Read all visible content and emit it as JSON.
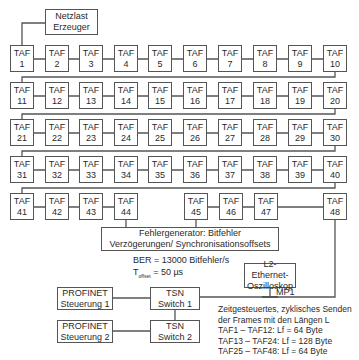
{
  "netzlast": {
    "line1": "Netzlast",
    "line2": "Erzeuger"
  },
  "taf_prefix": "TAF",
  "rows": [
    [
      "1",
      "2",
      "3",
      "4",
      "5",
      "6",
      "7",
      "8",
      "9",
      "10"
    ],
    [
      "11",
      "12",
      "13",
      "14",
      "15",
      "16",
      "17",
      "18",
      "19",
      "20"
    ],
    [
      "21",
      "22",
      "23",
      "24",
      "25",
      "26",
      "27",
      "28",
      "29",
      "30"
    ],
    [
      "31",
      "32",
      "33",
      "34",
      "35",
      "36",
      "37",
      "38",
      "39",
      "40"
    ],
    [
      "41",
      "42",
      "43",
      "44",
      "45",
      "46",
      "47",
      "48"
    ]
  ],
  "fehlergenerator": {
    "line1": "Fehlergenerator: Bitfehler",
    "line2": "Verzögerungen/ Synchronisationsoffsets"
  },
  "ber": "BER = 13000 Bitfehler/s",
  "toffset": {
    "symbol": "T",
    "subscript": "offset",
    "value": " = 50 µs"
  },
  "oszilloskop": {
    "line1": "L2-Ethernet-",
    "line2": "Oszilloskop"
  },
  "mp1": "MP1",
  "profinet1": {
    "line1": "PROFINET",
    "line2": "Steuerung 1"
  },
  "profinet2": {
    "line1": "PROFINET",
    "line2": "Steuerung 2"
  },
  "tsn1": {
    "line1": "TSN",
    "line2": "Switch 1"
  },
  "tsn2": {
    "line1": "TSN",
    "line2": "Switch 2"
  },
  "notes": [
    "Zeitgesteuertes, zyklisches Senden",
    "der Frames mit den Längen L",
    "TAF1 – TAF12: Lf = 64 Byte",
    "TAF13 – TAF24: Lf = 128 Byte",
    "TAF25 – TAF48: Lf = 64 Byte"
  ]
}
